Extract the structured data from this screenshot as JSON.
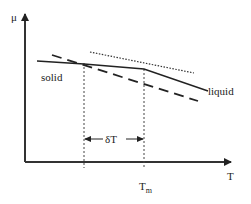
{
  "diagram": {
    "type": "chemical-potential-vs-temperature",
    "axes": {
      "y_label": "μ",
      "x_label": "T"
    },
    "curves": [
      {
        "name": "solid",
        "style": "solid",
        "label": "solid"
      },
      {
        "name": "liquid",
        "style": "dashed",
        "label": "liquid"
      },
      {
        "name": "tangent",
        "style": "dotted"
      }
    ],
    "annotations": {
      "interval_label": "δT",
      "melting_temp_label": "T",
      "melting_temp_subscript": "m"
    },
    "colors": {
      "line": "#222222",
      "axis": "#333333",
      "background": "#ffffff"
    }
  }
}
